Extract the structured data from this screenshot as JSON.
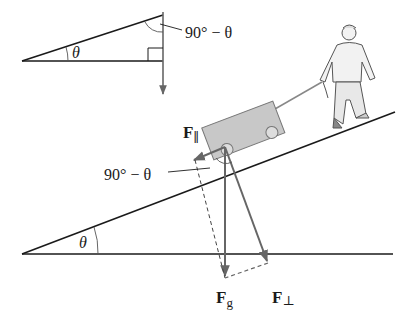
{
  "colors": {
    "line": "#1a1a1a",
    "vector": "#666666",
    "cart_fill": "#c8c8c8",
    "cart_stroke": "#777777",
    "person": "#555555"
  },
  "inset_triangle": {
    "angle_label": "θ",
    "complement_label": "90° − θ"
  },
  "main_diagram": {
    "incline_angle_label": "θ",
    "cart_angle_label": "90° − θ",
    "vectors": {
      "parallel": {
        "symbol": "F",
        "subscript": "∥"
      },
      "gravity": {
        "symbol": "F",
        "subscript": "g"
      },
      "perpendicular": {
        "symbol": "F",
        "subscript": "⊥"
      }
    }
  }
}
